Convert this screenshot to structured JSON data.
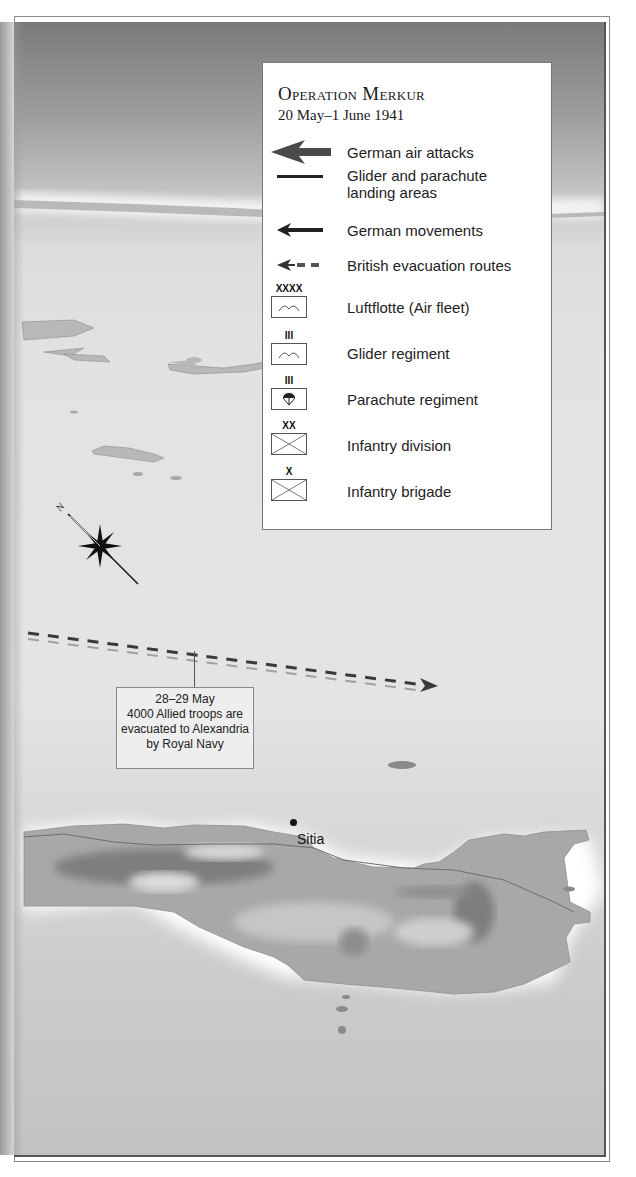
{
  "legend": {
    "title": "Operation Merkur",
    "subtitle": "20 May–1 June 1941",
    "items": [
      {
        "symbol": "thick-arrow-left-icon",
        "label": "German air attacks"
      },
      {
        "symbol": "line-icon",
        "label_line1": "Glider and parachute",
        "label_line2": "landing areas"
      },
      {
        "symbol": "thin-arrow-left-icon",
        "label": "German movements"
      },
      {
        "symbol": "dashed-arrow-left-icon",
        "label": "British evacuation routes"
      },
      {
        "symbol": "air-fleet-unit-icon",
        "echelon": "XXXX",
        "label": "Luftflotte (Air fleet)"
      },
      {
        "symbol": "glider-unit-icon",
        "echelon": "III",
        "label": "Glider regiment"
      },
      {
        "symbol": "parachute-unit-icon",
        "echelon": "III",
        "label": "Parachute regiment"
      },
      {
        "symbol": "infantry-unit-icon",
        "echelon": "XX",
        "label": "Infantry division"
      },
      {
        "symbol": "infantry-unit-icon",
        "echelon": "X",
        "label": "Infantry brigade"
      }
    ]
  },
  "annotation": {
    "line1": "28–29 May",
    "line2": "4000 Allied troops are",
    "line3": "evacuated to Alexandria",
    "line4": "by Royal Navy"
  },
  "places": [
    {
      "name": "Sitia"
    }
  ],
  "compass": {
    "north_label": "N"
  },
  "colors": {
    "sea_dark": "#7a7a7a",
    "sea_light": "#e3e3e3",
    "land": "#a8a8a8",
    "legend_bg": "#ffffff",
    "annotation_bg": "#eeeeee",
    "route_dark": "#3a3a3a",
    "route_light": "#9a9a9a"
  }
}
